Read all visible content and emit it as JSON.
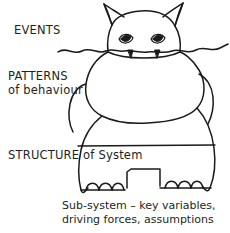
{
  "diagram": {
    "title_labels": {
      "events": "EVENTS",
      "patterns_line1": "PATTERNS",
      "patterns_line2": "of behaviour",
      "structure": "STRUCTURE of System"
    },
    "caption": {
      "line1": "Sub-system – key variables,",
      "line2": "driving forces, assumptions"
    },
    "colors": {
      "background": "#ffffff",
      "ink": "#231f20",
      "stroke": "#1a1a1a"
    },
    "figure": {
      "description": "hand-drawn hippopotamus partly submerged in water",
      "parts": [
        "left-ear",
        "right-ear",
        "head",
        "left-eye",
        "right-eye",
        "left-tusk",
        "right-tusk",
        "waterline",
        "upper-body",
        "left-arm",
        "right-arm",
        "lower-body",
        "structure-line",
        "leg-gap-notch",
        "left-foot-toes",
        "right-foot-toes"
      ]
    }
  }
}
